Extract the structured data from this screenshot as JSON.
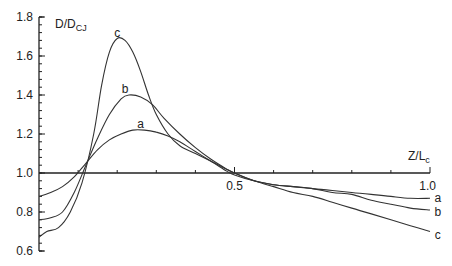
{
  "chart_data": {
    "type": "line",
    "title": "",
    "xlabel": "Z/L_c",
    "ylabel": "D/D_CJ",
    "xlim": [
      0,
      1.0
    ],
    "ylim": [
      0.6,
      1.8
    ],
    "x_ticks": [
      0,
      0.5,
      1.0
    ],
    "x_tick_labels": [
      "",
      "0.5",
      "1.0"
    ],
    "x_minor_ticks": [
      0.1,
      0.2,
      0.3,
      0.4,
      0.6,
      0.7,
      0.8,
      0.9
    ],
    "y_ticks": [
      0.6,
      0.8,
      1.0,
      1.2,
      1.4,
      1.6,
      1.8
    ],
    "y_tick_labels": [
      "0.6",
      "0.8",
      "1.0",
      "1.2",
      "1.4",
      "1.6",
      "1.8"
    ],
    "x_axis_at_y": 1.0,
    "grid": false,
    "legend": "inline labels at curve peaks and right ends",
    "series": [
      {
        "name": "a",
        "x": [
          0.0,
          0.03,
          0.06,
          0.09,
          0.12,
          0.15,
          0.18,
          0.21,
          0.24,
          0.27,
          0.3,
          0.33,
          0.36,
          0.4,
          0.44,
          0.48,
          0.5,
          0.55,
          0.6,
          0.65,
          0.7,
          0.75,
          0.8,
          0.85,
          0.9,
          0.95,
          1.0
        ],
        "values": [
          0.88,
          0.9,
          0.93,
          0.98,
          1.05,
          1.12,
          1.17,
          1.2,
          1.22,
          1.22,
          1.21,
          1.19,
          1.16,
          1.11,
          1.06,
          1.01,
          0.99,
          0.96,
          0.94,
          0.93,
          0.92,
          0.91,
          0.9,
          0.89,
          0.88,
          0.87,
          0.87
        ]
      },
      {
        "name": "b",
        "x": [
          0.0,
          0.03,
          0.06,
          0.09,
          0.12,
          0.15,
          0.18,
          0.21,
          0.23,
          0.26,
          0.29,
          0.32,
          0.36,
          0.4,
          0.44,
          0.48,
          0.5,
          0.55,
          0.6,
          0.65,
          0.7,
          0.75,
          0.8,
          0.85,
          0.9,
          0.95,
          1.0
        ],
        "values": [
          0.76,
          0.77,
          0.8,
          0.9,
          1.04,
          1.18,
          1.3,
          1.38,
          1.4,
          1.39,
          1.35,
          1.28,
          1.2,
          1.13,
          1.07,
          1.02,
          1.0,
          0.96,
          0.94,
          0.93,
          0.92,
          0.9,
          0.89,
          0.86,
          0.84,
          0.82,
          0.81
        ]
      },
      {
        "name": "c",
        "x": [
          0.0,
          0.02,
          0.05,
          0.08,
          0.11,
          0.14,
          0.16,
          0.18,
          0.2,
          0.22,
          0.24,
          0.26,
          0.28,
          0.3,
          0.33,
          0.36,
          0.4,
          0.45,
          0.5,
          0.55,
          0.6,
          0.65,
          0.7,
          0.75,
          0.8,
          0.85,
          0.9,
          0.95,
          1.0
        ],
        "values": [
          0.67,
          0.7,
          0.72,
          0.8,
          0.95,
          1.2,
          1.45,
          1.62,
          1.69,
          1.68,
          1.62,
          1.52,
          1.4,
          1.3,
          1.2,
          1.14,
          1.1,
          1.05,
          1.0,
          0.96,
          0.93,
          0.9,
          0.88,
          0.85,
          0.82,
          0.79,
          0.76,
          0.73,
          0.7
        ]
      }
    ],
    "annotations": [
      {
        "text": "a",
        "x": 0.26,
        "y": 1.25
      },
      {
        "text": "b",
        "x": 0.22,
        "y": 1.43
      },
      {
        "text": "c",
        "x": 0.2,
        "y": 1.72
      },
      {
        "text": "a",
        "x": 1.02,
        "y": 0.87
      },
      {
        "text": "b",
        "x": 1.02,
        "y": 0.8
      },
      {
        "text": "c",
        "x": 1.02,
        "y": 0.68
      }
    ]
  },
  "labels": {
    "y_axis_main": "D/D",
    "y_axis_sub": "CJ",
    "x_axis_main": "Z/L",
    "x_axis_sub": "c"
  }
}
